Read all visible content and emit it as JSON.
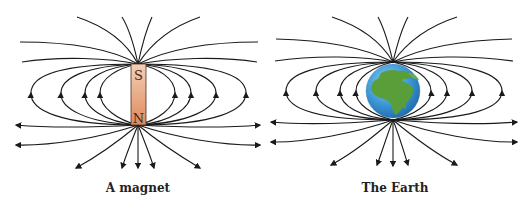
{
  "diagram": {
    "panels": [
      {
        "id": "magnet",
        "caption": "A magnet",
        "poles": {
          "top": "S",
          "bottom": "N"
        }
      },
      {
        "id": "earth",
        "caption": "The Earth"
      }
    ]
  },
  "colors": {
    "field_line": "#1a1a1a",
    "magnet_top": "#f0c4a6",
    "magnet_bottom": "#e08a5c",
    "magnet_border": "#4a3020",
    "ocean": "#3a8fd0",
    "land": "#5a9e3a"
  }
}
